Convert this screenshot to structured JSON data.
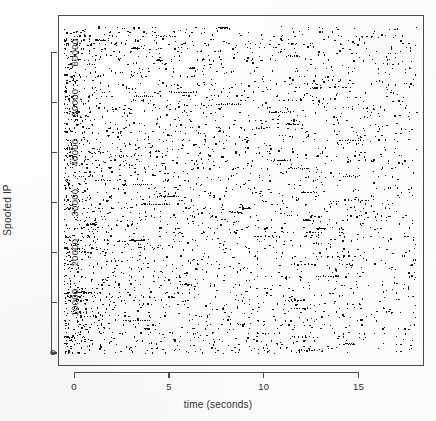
{
  "figure": {
    "width": 436,
    "height": 421,
    "background_color": "#fefefe",
    "frame_color": "#4a4a4a",
    "point_color": "#161616"
  },
  "chart_data": {
    "type": "scatter",
    "title": "",
    "xlabel": "time (seconds)",
    "ylabel": "Spoofed IP",
    "xlim": [
      -0.85,
      18.45
    ],
    "ylim": [
      -2600,
      67500
    ],
    "xticks": [
      0,
      5,
      10,
      15
    ],
    "xtick_labels": [
      "0",
      "5",
      "10",
      "15"
    ],
    "yticks": [
      0,
      10000,
      20000,
      30000,
      40000,
      50000,
      60000
    ],
    "ytick_labels": [
      "0",
      "10000",
      "20000",
      "30000",
      "40000",
      "50000",
      "60000"
    ],
    "grid": false,
    "legend": null,
    "marker": "point",
    "marker_size_px": 1.25,
    "n_points_approx": 2600,
    "band_y_values": [
      200,
      700,
      1200,
      1900,
      2600,
      3300,
      4100,
      5000,
      5800,
      6600,
      7400,
      8200,
      9000,
      9800,
      10600,
      11400,
      12200,
      13000,
      13800,
      14600,
      15400,
      16200,
      17000,
      17800,
      18600,
      19400,
      20200,
      21000,
      21800,
      22600,
      23400,
      24200,
      25000,
      25800,
      26600,
      27400,
      28200,
      29000,
      29800,
      30600,
      31400,
      32200,
      33000,
      33800,
      34600,
      35400,
      36200,
      37000,
      37800,
      38600,
      39400,
      40200,
      41000,
      41800,
      42600,
      43400,
      44200,
      45000,
      45800,
      46600,
      47400,
      48200,
      49000,
      49800,
      50600,
      51400,
      52200,
      53000,
      53800,
      54600,
      55400,
      56200,
      57000,
      57800,
      58600,
      59400,
      60200,
      61000,
      61800,
      62600,
      63400,
      64200,
      65000
    ],
    "x_range_observed": [
      -0.55,
      18.1
    ],
    "y_range_observed": [
      0,
      65500
    ]
  }
}
